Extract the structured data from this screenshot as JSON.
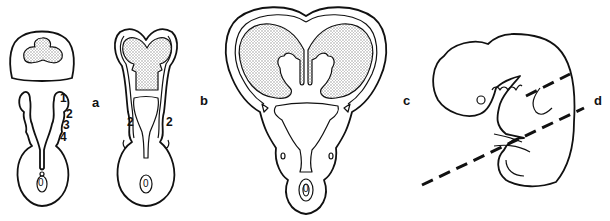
{
  "figure": {
    "panels": [
      {
        "id": "a",
        "label": "a",
        "description": "Early cross section: upper stippled trilobed region within arch; lower paired lateral bulges with neural tube and notochord",
        "numbers": [
          "1",
          "2",
          "3",
          "4"
        ],
        "center_label": "0"
      },
      {
        "id": "b",
        "label": "b",
        "description": "Intermediate cross section: bilobed stippled region; lateral labels and curved arrows",
        "numbers": [
          "2",
          "2"
        ],
        "center_label": "0"
      },
      {
        "id": "c",
        "label": "c",
        "description": "Later cross section: large heart-shaped stippled hemispheres with central cavity structures",
        "center_label": "0"
      },
      {
        "id": "d",
        "label": "d",
        "description": "Lateral outline of embryo with dashed section line through head and pharyngeal arches"
      }
    ],
    "colors": {
      "line": "#111111",
      "background": "#ffffff",
      "stipple": "#9a9a9a"
    }
  }
}
